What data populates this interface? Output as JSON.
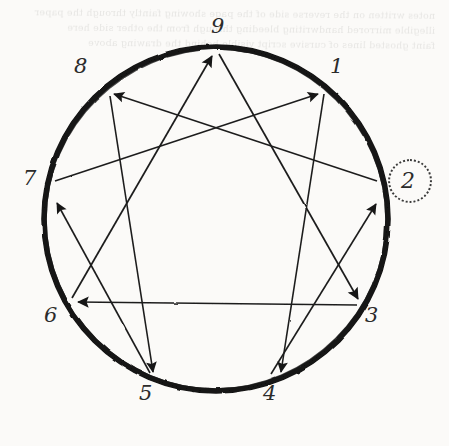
{
  "page": {
    "background_color": "#fbfaf8",
    "ink_color": "#1c1c1c",
    "bleed_through_text": "notes written on the reverse side of the page showing faintly through the paper\nillegible mirrored handwriting bleeding through from the other side here\nfaint ghosted lines of cursive script visible behind the drawing above"
  },
  "diagram": {
    "type": "enneagram",
    "circle": {
      "cx": 216,
      "cy": 219,
      "r": 172,
      "stroke_color": "#111111",
      "stroke_width": 6
    },
    "points": [
      {
        "id": "9",
        "label": "9",
        "angle_deg": 270,
        "x": 216,
        "y": 47
      },
      {
        "id": "1",
        "label": "1",
        "angle_deg": 310,
        "x": 326,
        "y": 88
      },
      {
        "id": "2",
        "label": "2",
        "angle_deg": 350,
        "x": 385,
        "y": 189
      },
      {
        "id": "3",
        "label": "3",
        "angle_deg": 30,
        "x": 365,
        "y": 305
      },
      {
        "id": "4",
        "label": "4",
        "angle_deg": 70,
        "x": 275,
        "y": 381
      },
      {
        "id": "5",
        "label": "5",
        "angle_deg": 110,
        "x": 157,
        "y": 381
      },
      {
        "id": "6",
        "label": "6",
        "angle_deg": 150,
        "x": 67,
        "y": 305
      },
      {
        "id": "7",
        "label": "7",
        "angle_deg": 190,
        "x": 47,
        "y": 189
      },
      {
        "id": "8",
        "label": "8",
        "angle_deg": 230,
        "x": 106,
        "y": 88
      }
    ],
    "inner_triangle": {
      "name": "triad-9-3-6",
      "arrows": [
        {
          "from": "9",
          "to": "3"
        },
        {
          "from": "3",
          "to": "6"
        },
        {
          "from": "6",
          "to": "9"
        }
      ]
    },
    "hexad": {
      "name": "hexad-1-4-2-8-5-7",
      "arrows": [
        {
          "from": "1",
          "to": "4"
        },
        {
          "from": "4",
          "to": "2"
        },
        {
          "from": "2",
          "to": "8"
        },
        {
          "from": "8",
          "to": "5"
        },
        {
          "from": "5",
          "to": "7"
        },
        {
          "from": "7",
          "to": "1"
        }
      ]
    },
    "annotations": [
      {
        "id": "highlight-2",
        "kind": "dotted-circle-highlight",
        "target_point": "2",
        "cx": 410,
        "cy": 181,
        "r": 22,
        "stroke_color": "#3a3a3a",
        "stroke_style": "dotted"
      }
    ]
  }
}
